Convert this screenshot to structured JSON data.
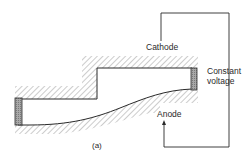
{
  "figure": {
    "labels": {
      "cathode": "Cathode",
      "anode": "Anode",
      "voltage_line1": "Constant",
      "voltage_line2": "voltage",
      "caption": "(a)"
    },
    "colors": {
      "line": "#2a2a2a",
      "hatch": "#8a8a8a",
      "electrode_fill": "#9a9a9a",
      "background": "#ffffff"
    }
  }
}
